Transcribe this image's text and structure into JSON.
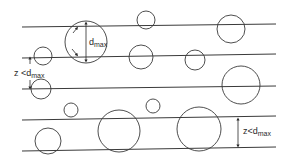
{
  "diagram": {
    "lines": [
      {
        "x1": 22,
        "y1": 27,
        "x2": 276,
        "y2": 24
      },
      {
        "x1": 22,
        "y1": 58,
        "x2": 276,
        "y2": 54
      },
      {
        "x1": 22,
        "y1": 89,
        "x2": 276,
        "y2": 86
      },
      {
        "x1": 22,
        "y1": 120,
        "x2": 276,
        "y2": 116
      },
      {
        "x1": 22,
        "y1": 151,
        "x2": 276,
        "y2": 147
      }
    ],
    "circles": [
      {
        "cx": 86,
        "cy": 42,
        "r": 21
      },
      {
        "cx": 146,
        "cy": 20,
        "r": 9
      },
      {
        "cx": 231,
        "cy": 29,
        "r": 14
      },
      {
        "cx": 43,
        "cy": 56,
        "r": 9
      },
      {
        "cx": 141,
        "cy": 57,
        "r": 12
      },
      {
        "cx": 195,
        "cy": 60,
        "r": 10
      },
      {
        "cx": 41,
        "cy": 89,
        "r": 10
      },
      {
        "cx": 71,
        "cy": 110,
        "r": 7
      },
      {
        "cx": 241,
        "cy": 85,
        "r": 19
      },
      {
        "cx": 48,
        "cy": 141,
        "r": 13
      },
      {
        "cx": 119,
        "cy": 131,
        "r": 21
      },
      {
        "cx": 153,
        "cy": 106,
        "r": 7
      },
      {
        "cx": 199,
        "cy": 129,
        "r": 22
      }
    ],
    "labels": {
      "dmax": {
        "main": "d",
        "sub": "max"
      },
      "z_left": {
        "prefix": "z <",
        "main": "d",
        "sub": "max"
      },
      "z_right": {
        "prefix": "z<",
        "main": "d",
        "sub": "max"
      }
    }
  }
}
